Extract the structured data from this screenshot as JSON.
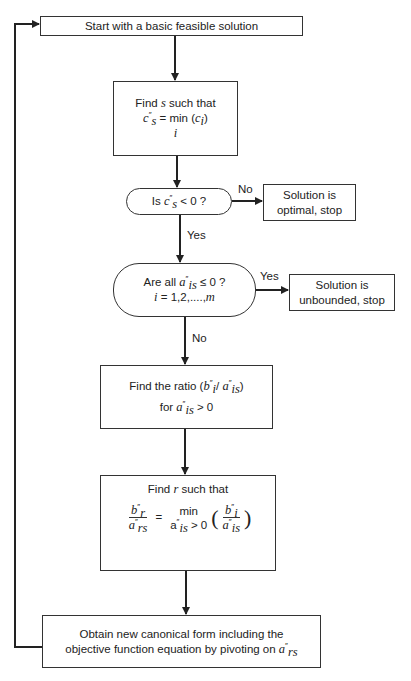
{
  "nodes": {
    "start": {
      "text": "Start with a basic feasible solution"
    },
    "find_s": {
      "line1": "Find s such that",
      "eq_lhs": "c″s",
      "eq_rhs": "= min (ci)",
      "under": "i"
    },
    "decision_cs": {
      "text": "Is c″s < 0 ?"
    },
    "optimal": {
      "line1": "Solution is",
      "line2": "optimal, stop"
    },
    "decision_ais": {
      "line1": "Are all a″is ≤ 0 ?",
      "line2": "i = 1,2,....,m"
    },
    "unbounded": {
      "line1": "Solution is",
      "line2": "unbounded, stop"
    },
    "ratio": {
      "line1": "Find the ratio (b″i / a″is)",
      "line2": "for a″is > 0"
    },
    "find_r": {
      "line1": "Find r such that",
      "lhs_num": "b″r",
      "lhs_den": "a″rs",
      "eq": "=",
      "min": "min",
      "min_cond": "a″is > 0",
      "rhs_num": "b″i",
      "rhs_den": "a″is"
    },
    "pivot": {
      "line1": "Obtain new canonical form including the",
      "line2": "objective function equation by pivoting on a″rs"
    }
  },
  "edge_labels": {
    "cs_no": "No",
    "cs_yes": "Yes",
    "ais_yes": "Yes",
    "ais_no": "No"
  },
  "colors": {
    "line": "#333333",
    "background": "#ffffff",
    "text": "#222222"
  }
}
